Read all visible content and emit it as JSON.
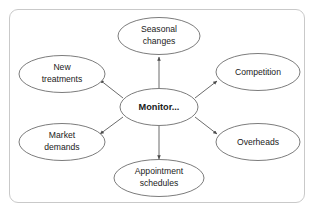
{
  "diagram": {
    "type": "spider-mind-map",
    "frame": {
      "border_color": "#c9c9c9",
      "background": "#ffffff"
    },
    "edge_color": "#5a5a5a",
    "node_border_color": "#6d6d6d",
    "center": {
      "id": "monitor",
      "label": "Monitor...",
      "bold": true
    },
    "branches": [
      {
        "id": "seasonal-changes",
        "label_line1": "Seasonal",
        "label_line2": "changes",
        "direction": "up",
        "arrow": "outward"
      },
      {
        "id": "new-treatments",
        "label_line1": "New",
        "label_line2": "treatments",
        "direction": "upper-left",
        "arrow": "outward"
      },
      {
        "id": "market-demands",
        "label_line1": "Market",
        "label_line2": "demands",
        "direction": "lower-left",
        "arrow": "outward"
      },
      {
        "id": "competition",
        "label_line1": "Competition",
        "label_line2": "",
        "direction": "upper-right",
        "arrow": "outward"
      },
      {
        "id": "overheads",
        "label_line1": "Overheads",
        "label_line2": "",
        "direction": "lower-right",
        "arrow": "outward"
      },
      {
        "id": "appointment-schedules",
        "label_line1": "Appointment",
        "label_line2": "schedules",
        "direction": "down",
        "arrow": "outward"
      }
    ]
  }
}
